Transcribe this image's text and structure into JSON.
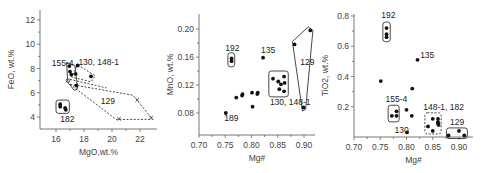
{
  "chart_data": [
    {
      "type": "scatter",
      "title": "",
      "xlabel": "MgO,wt.%",
      "ylabel": "FeO, wt.%",
      "xlim": [
        15,
        23.2
      ],
      "ylim": [
        3,
        13
      ],
      "xticks": [
        16,
        18,
        20,
        22
      ],
      "yticks": [
        4,
        6,
        8,
        10,
        12
      ],
      "grid": false,
      "frame": {
        "x0": 40,
        "x1": 157,
        "y0": 10,
        "y1": 129,
        "xpx": [
          [
            16,
            56
          ],
          [
            22,
            140
          ]
        ],
        "ypx": [
          [
            12,
            20
          ],
          [
            4,
            117
          ]
        ]
      },
      "series": [
        {
          "name": "filled",
          "marker": "dot",
          "points": [
            [
              16.95,
              8.2
            ],
            [
              17.0,
              7.75
            ],
            [
              17.1,
              7.5
            ],
            [
              17.4,
              7.55
            ],
            [
              17.45,
              6.6
            ],
            [
              17.55,
              8.25
            ],
            [
              18.5,
              7.35
            ],
            [
              16.3,
              5.05
            ],
            [
              16.3,
              4.85
            ],
            [
              16.65,
              4.75
            ],
            [
              16.7,
              4.6
            ]
          ]
        },
        {
          "name": "open",
          "marker": "circle",
          "points": [
            [
              16.85,
              7.0
            ]
          ]
        },
        {
          "name": "129",
          "marker": "x",
          "points": [
            [
              20.5,
              3.85
            ],
            [
              21.8,
              5.4
            ],
            [
              22.8,
              3.95
            ]
          ]
        }
      ],
      "groups": [
        {
          "label": "155-4",
          "style": "solid",
          "shape": [
            [
              16.75,
              8.5
            ],
            [
              17.35,
              8.25
            ],
            [
              17.55,
              6.35
            ],
            [
              17.3,
              6.2
            ],
            [
              16.85,
              6.85
            ]
          ]
        },
        {
          "label": "130, 148-1",
          "style": "dashed",
          "shape": [
            [
              17.55,
              8.3
            ],
            [
              18.8,
              7.4
            ],
            [
              18.5,
              6.9
            ],
            [
              17.1,
              7.3
            ]
          ]
        },
        {
          "label": "",
          "style": "dashed",
          "shape": [
            [
              17.0,
              7.1
            ],
            [
              19.6,
              6.4
            ]
          ]
        },
        {
          "label": "129",
          "style": "dashed",
          "shape": [
            [
              17.0,
              6.7
            ],
            [
              20.3,
              3.8
            ],
            [
              22.9,
              3.8
            ],
            [
              21.5,
              5.8
            ]
          ]
        },
        {
          "label": "182",
          "style": "solid-box",
          "shape": [
            [
              16.0,
              5.4
            ],
            [
              16.95,
              4.3
            ]
          ]
        }
      ],
      "annotations": [
        {
          "text": "155-4",
          "x": 15.7,
          "y": 8.2
        },
        {
          "text": "130, 148-1",
          "x": 17.6,
          "y": 8.25
        },
        {
          "text": "129",
          "x": 19.2,
          "y": 5.05
        },
        {
          "text": "182",
          "x": 16.3,
          "y": 3.6
        }
      ]
    },
    {
      "type": "scatter",
      "title": "",
      "xlabel": "Mg#",
      "ylabel": "MnO, wt.%",
      "xlim": [
        0.7,
        0.925
      ],
      "ylim": [
        0.05,
        0.22
      ],
      "xticks": [
        0.7,
        0.75,
        0.8,
        0.85,
        0.9
      ],
      "yticks": [
        0.08,
        0.12,
        0.16,
        0.2
      ],
      "grid": false,
      "frame": {
        "x0": 199,
        "x1": 315,
        "y0": 14,
        "y1": 135,
        "xpx": [
          [
            0.7,
            199
          ],
          [
            0.9,
            304
          ]
        ],
        "ypx": [
          [
            0.2,
            29
          ],
          [
            0.08,
            113
          ]
        ]
      },
      "series": [
        {
          "name": "samples",
          "marker": "dot",
          "points": [
            [
              0.751,
              0.08
            ],
            [
              0.771,
              0.102
            ],
            [
              0.782,
              0.105
            ],
            [
              0.783,
              0.107
            ],
            [
              0.801,
              0.109
            ],
            [
              0.802,
              0.089
            ],
            [
              0.811,
              0.107
            ],
            [
              0.812,
              0.109
            ],
            [
              0.822,
              0.159
            ],
            [
              0.762,
              0.154
            ],
            [
              0.762,
              0.158
            ],
            [
              0.841,
              0.129
            ],
            [
              0.851,
              0.125
            ],
            [
              0.853,
              0.114
            ],
            [
              0.862,
              0.132
            ],
            [
              0.863,
              0.123
            ],
            [
              0.862,
              0.111
            ],
            [
              0.856,
              0.121
            ],
            [
              0.882,
              0.178
            ],
            [
              0.912,
              0.198
            ],
            [
              0.899,
              0.088
            ]
          ]
        }
      ],
      "groups": [
        {
          "label": "192",
          "style": "solid-box",
          "shape": [
            [
              0.755,
              0.166
            ],
            [
              0.768,
              0.146
            ]
          ]
        },
        {
          "label": "130, 148-1",
          "style": "solid-box",
          "shape": [
            [
              0.833,
              0.14
            ],
            [
              0.87,
              0.103
            ]
          ]
        },
        {
          "label": "129",
          "style": "solid",
          "shape": [
            [
              0.878,
              0.182
            ],
            [
              0.908,
              0.203
            ],
            [
              0.917,
              0.198
            ],
            [
              0.903,
              0.085
            ],
            [
              0.897,
              0.083
            ]
          ]
        }
      ],
      "annotations": [
        {
          "text": "192",
          "x": 0.75,
          "y": 0.168
        },
        {
          "text": "135",
          "x": 0.818,
          "y": 0.166
        },
        {
          "text": "129",
          "x": 0.893,
          "y": 0.148
        },
        {
          "text": "130, 148-1",
          "x": 0.835,
          "y": 0.092
        },
        {
          "text": "189",
          "x": 0.748,
          "y": 0.068
        }
      ]
    },
    {
      "type": "scatter",
      "title": "",
      "xlabel": "Mg#",
      "ylabel": "TiO2, wt.%",
      "xlim": [
        0.7,
        0.925
      ],
      "ylim": [
        0.0,
        0.82
      ],
      "xticks": [
        0.7,
        0.75,
        0.8,
        0.85,
        0.9
      ],
      "yticks": [
        0.2,
        0.4,
        0.6,
        0.8
      ],
      "grid": false,
      "frame": {
        "x0": 354,
        "x1": 473,
        "y0": 14,
        "y1": 137,
        "xpx": [
          [
            0.7,
            354
          ],
          [
            0.9,
            459
          ]
        ],
        "ypx": [
          [
            0.8,
            16
          ],
          [
            0.0,
            137
          ]
        ]
      },
      "series": [
        {
          "name": "samples",
          "marker": "dot",
          "points": [
            [
              0.762,
              0.72
            ],
            [
              0.762,
              0.68
            ],
            [
              0.762,
              0.66
            ],
            [
              0.821,
              0.51
            ],
            [
              0.751,
              0.37
            ],
            [
              0.811,
              0.32
            ],
            [
              0.8,
              0.18
            ],
            [
              0.81,
              0.14
            ],
            [
              0.772,
              0.14
            ],
            [
              0.781,
              0.14
            ],
            [
              0.781,
              0.17
            ],
            [
              0.801,
              0.03
            ],
            [
              0.841,
              0.07
            ],
            [
              0.85,
              0.12
            ],
            [
              0.85,
              0.04
            ],
            [
              0.86,
              0.12
            ],
            [
              0.86,
              0.1
            ],
            [
              0.86,
              0.09
            ],
            [
              0.861,
              0.08
            ],
            [
              0.88,
              0.01
            ],
            [
              0.9,
              0.04
            ],
            [
              0.91,
              0.01
            ]
          ]
        }
      ],
      "groups": [
        {
          "label": "192",
          "style": "solid-box",
          "shape": [
            [
              0.755,
              0.76
            ],
            [
              0.769,
              0.63
            ]
          ]
        },
        {
          "label": "155-4",
          "style": "solid-box",
          "shape": [
            [
              0.765,
              0.21
            ],
            [
              0.786,
              0.1
            ]
          ]
        },
        {
          "label": "148-1, 182",
          "style": "dashed-box",
          "shape": [
            [
              0.835,
              0.16
            ],
            [
              0.866,
              0.02
            ]
          ]
        },
        {
          "label": "129",
          "style": "solid-box",
          "shape": [
            [
              0.876,
              0.06
            ],
            [
              0.916,
              -0.01
            ]
          ]
        }
      ],
      "annotations": [
        {
          "text": "192",
          "x": 0.752,
          "y": 0.79
        },
        {
          "text": "135",
          "x": 0.826,
          "y": 0.52
        },
        {
          "text": "155-4",
          "x": 0.76,
          "y": 0.23
        },
        {
          "text": "148-1, 182",
          "x": 0.832,
          "y": 0.18
        },
        {
          "text": "129",
          "x": 0.883,
          "y": 0.08
        },
        {
          "text": "130",
          "x": 0.777,
          "y": 0.025
        }
      ]
    }
  ]
}
